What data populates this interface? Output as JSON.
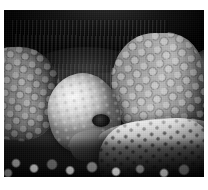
{
  "photo": {
    "alt_text": "Black and white photograph of a Galapagos giant tortoise lowering its head toward a prickly pear cactus pad",
    "caption": "",
    "color_mode": "black-and-white",
    "frame": {
      "background_color": "#ffffff",
      "margin_top_px": 10,
      "margin_left_px": 4,
      "margin_right_px": 4,
      "margin_bottom_px": 13,
      "image_width_px": 200,
      "image_height_px": 167
    },
    "palette": {
      "highlight": "#f2f2f2",
      "midtone": "#9e9e9e",
      "shadow": "#2a2a2a",
      "deep_shadow": "#0a0a0a"
    },
    "subjects": [
      {
        "name": "carapace-shadow",
        "label": "Dark tortoise shell overhang",
        "region": "top"
      },
      {
        "name": "neck-folds",
        "label": "Wrinkled neck skin folds",
        "region": "upper-center"
      },
      {
        "name": "tortoise-head",
        "label": "Pale tortoise head",
        "region": "center-left"
      },
      {
        "name": "tortoise-eye",
        "label": "Dark eye",
        "region": "center"
      },
      {
        "name": "tortoise-beak",
        "label": "Beak",
        "region": "center-lower"
      },
      {
        "name": "scaly-leg-right",
        "label": "Scaled foreleg with hexagonal scutes",
        "region": "right"
      },
      {
        "name": "scaly-leg-left",
        "label": "Scaled foreleg in shadow",
        "region": "left"
      },
      {
        "name": "cactus-pad",
        "label": "Prickly pear cactus pad with spine clusters",
        "region": "lower-right"
      },
      {
        "name": "rocky-ground",
        "label": "Rocky rubble ground",
        "region": "bottom"
      },
      {
        "name": "rocky-background",
        "label": "Textured rock backdrop",
        "region": "upper-right"
      }
    ]
  }
}
